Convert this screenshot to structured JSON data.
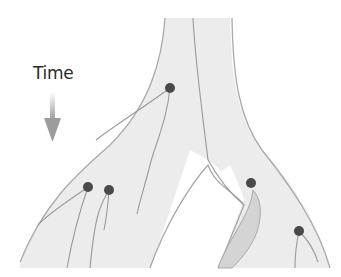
{
  "diagram": {
    "type": "gene-tree-in-species-tree",
    "time_label": "Time",
    "time_arrow_direction": "down",
    "colors": {
      "species_fill": "#ececec",
      "species_edge": "#a9a9a9",
      "lineage_line": "#9a9a9a",
      "node_dot": "#4a4a4a",
      "shaded_branch": "#d4d4d4",
      "arrow": "#9c9c9c"
    },
    "coalescent_nodes": [
      {
        "id": "trunk-node",
        "x": 170,
        "y": 88
      },
      {
        "id": "left-node-1",
        "x": 88,
        "y": 187
      },
      {
        "id": "left-node-2",
        "x": 109,
        "y": 190
      },
      {
        "id": "right-node-1",
        "x": 251,
        "y": 183
      },
      {
        "id": "right-node-2",
        "x": 299,
        "y": 231
      }
    ]
  }
}
